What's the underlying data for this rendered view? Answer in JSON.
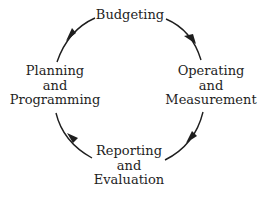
{
  "diagram": {
    "type": "cycle",
    "direction": "clockwise",
    "stroke_color": "#1e1e1e",
    "background": "#ffffff",
    "nodes": [
      {
        "id": "budgeting",
        "lines": [
          "Budgeting"
        ]
      },
      {
        "id": "operating",
        "lines": [
          "Operating",
          "and",
          "Measurement"
        ]
      },
      {
        "id": "reporting",
        "lines": [
          "Reporting",
          "and",
          "Evaluation"
        ]
      },
      {
        "id": "planning",
        "lines": [
          "Planning",
          "and",
          "Programming"
        ]
      }
    ],
    "edges": [
      {
        "from": "budgeting",
        "to": "operating"
      },
      {
        "from": "operating",
        "to": "reporting"
      },
      {
        "from": "reporting",
        "to": "planning"
      },
      {
        "from": "planning",
        "to": "budgeting"
      }
    ]
  }
}
